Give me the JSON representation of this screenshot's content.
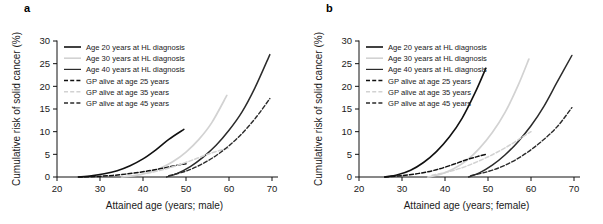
{
  "figure": {
    "panels": [
      {
        "label": "a",
        "name": "panel-a",
        "xlabel": "Attained age (years; male)",
        "ylabel": "Cumulative risk of solid cancer (%)"
      },
      {
        "label": "b",
        "name": "panel-b",
        "xlabel": "Attained age (years; female)",
        "ylabel": "Cumulative risk of solid cancer (%)"
      }
    ],
    "legend": [
      {
        "label": "Age 20 years at HL diagnosis",
        "color": "#111111",
        "dash": "none",
        "width": 1.6
      },
      {
        "label": "Age 30 years at HL diagnosis",
        "color": "#d2d2d2",
        "dash": "none",
        "width": 1.6
      },
      {
        "label": "Age 40 years at HL diagnosis",
        "color": "#2b2b2b",
        "dash": "none",
        "width": 1.2
      },
      {
        "label": "GP alive at age 25 years",
        "color": "#111111",
        "dash": "4,2.2",
        "width": 1.5
      },
      {
        "label": "GP alive at age 35 years",
        "color": "#d2d2d2",
        "dash": "4,2.2",
        "width": 1.5
      },
      {
        "label": "GP alive at age 45 years",
        "color": "#2b2b2b",
        "dash": "4,2.2",
        "width": 1.3
      }
    ]
  },
  "chart_data": [
    {
      "type": "line",
      "panel": "a",
      "title": "",
      "xlabel": "Attained age (years; male)",
      "ylabel": "Cumulative risk of solid cancer (%)",
      "xlim": [
        20,
        70
      ],
      "ylim": [
        0,
        30
      ],
      "xticks": [
        20,
        30,
        40,
        50,
        60,
        70
      ],
      "yticks": [
        0,
        5,
        10,
        15,
        20,
        25,
        30
      ],
      "grid": false,
      "legend_position": "upper left",
      "series": [
        {
          "name": "Age 20 years at HL diagnosis",
          "color": "#111111",
          "dash": "none",
          "width": 1.6,
          "x": [
            25,
            28,
            31,
            34,
            37,
            40,
            43,
            46,
            49.5
          ],
          "y": [
            0.0,
            0.25,
            0.7,
            1.4,
            2.5,
            4.0,
            6.0,
            8.3,
            10.5
          ]
        },
        {
          "name": "Age 30 years at HL diagnosis",
          "color": "#d2d2d2",
          "dash": "none",
          "width": 1.7,
          "x": [
            35,
            38,
            41,
            44,
            47,
            50,
            53,
            56,
            59.5
          ],
          "y": [
            0.0,
            0.3,
            0.9,
            1.9,
            3.4,
            5.5,
            8.3,
            12.0,
            18.0
          ]
        },
        {
          "name": "Age 40 years at HL diagnosis",
          "color": "#2b2b2b",
          "dash": "none",
          "width": 1.5,
          "x": [
            45.5,
            48,
            51,
            54,
            57,
            60,
            63,
            66,
            69.5
          ],
          "y": [
            0.0,
            0.8,
            2.3,
            4.4,
            7.0,
            10.3,
            14.3,
            19.6,
            27.0
          ]
        },
        {
          "name": "GP alive at age 25 years",
          "color": "#111111",
          "dash": "4,2.2",
          "width": 1.5,
          "x": [
            25,
            29,
            33,
            37,
            41,
            45,
            48,
            50
          ],
          "y": [
            0.0,
            0.12,
            0.35,
            0.75,
            1.3,
            2.0,
            2.6,
            2.9
          ]
        },
        {
          "name": "GP alive at age 35 years",
          "color": "#d2d2d2",
          "dash": "4,2.2",
          "width": 1.5,
          "x": [
            41,
            45,
            49,
            52,
            55,
            58,
            60
          ],
          "y": [
            0.8,
            1.7,
            2.9,
            3.9,
            5.0,
            5.9,
            6.4
          ]
        },
        {
          "name": "GP alive at age 45 years",
          "color": "#2b2b2b",
          "dash": "4,2.2",
          "width": 1.4,
          "x": [
            46,
            50,
            54,
            58,
            62,
            66,
            69.5
          ],
          "y": [
            0.3,
            1.3,
            3.0,
            5.4,
            8.6,
            12.8,
            17.3
          ]
        }
      ]
    },
    {
      "type": "line",
      "panel": "b",
      "title": "",
      "xlabel": "Attained age (years; female)",
      "ylabel": "Cumulative risk of solid cancer (%)",
      "xlim": [
        20,
        70
      ],
      "ylim": [
        0,
        30
      ],
      "xticks": [
        20,
        30,
        40,
        50,
        60,
        70
      ],
      "yticks": [
        0,
        5,
        10,
        15,
        20,
        25,
        30
      ],
      "grid": false,
      "legend_position": "upper left",
      "series": [
        {
          "name": "Age 20 years at HL diagnosis",
          "color": "#111111",
          "dash": "none",
          "width": 1.6,
          "x": [
            26,
            29,
            32,
            35,
            38,
            41,
            44,
            47,
            49.5
          ],
          "y": [
            0.0,
            0.5,
            1.5,
            3.2,
            5.6,
            8.8,
            13.0,
            18.6,
            24.0
          ]
        },
        {
          "name": "Age 30 years at HL diagnosis",
          "color": "#d2d2d2",
          "dash": "none",
          "width": 1.7,
          "x": [
            36,
            39,
            42,
            45,
            48,
            51,
            54,
            57,
            59.5
          ],
          "y": [
            0.0,
            0.6,
            1.8,
            3.6,
            6.3,
            9.8,
            14.3,
            20.2,
            26.0
          ]
        },
        {
          "name": "Age 40 years at HL diagnosis",
          "color": "#2b2b2b",
          "dash": "none",
          "width": 1.5,
          "x": [
            45.5,
            48,
            51,
            54,
            57,
            60,
            63,
            66,
            69.5
          ],
          "y": [
            0.0,
            0.9,
            2.6,
            4.9,
            7.8,
            11.3,
            15.6,
            20.8,
            26.8
          ]
        },
        {
          "name": "GP alive at age 25 years",
          "color": "#111111",
          "dash": "4,2.2",
          "width": 1.5,
          "x": [
            26,
            30,
            34,
            38,
            42,
            45,
            47.5,
            49.5
          ],
          "y": [
            0.0,
            0.3,
            0.8,
            1.6,
            2.8,
            3.8,
            4.5,
            5.0
          ]
        },
        {
          "name": "GP alive at age 35 years",
          "color": "#d2d2d2",
          "dash": "4,2.2",
          "width": 1.5,
          "x": [
            37,
            41,
            45,
            49,
            52,
            55,
            58,
            60
          ],
          "y": [
            0.4,
            1.2,
            2.4,
            4.0,
            5.4,
            7.0,
            8.8,
            10.0
          ]
        },
        {
          "name": "GP alive at age 45 years",
          "color": "#2b2b2b",
          "dash": "4,2.2",
          "width": 1.4,
          "x": [
            46,
            50,
            54,
            58,
            62,
            66,
            69.5
          ],
          "y": [
            0.3,
            1.2,
            2.6,
            4.7,
            7.5,
            11.0,
            15.3
          ]
        }
      ]
    }
  ]
}
